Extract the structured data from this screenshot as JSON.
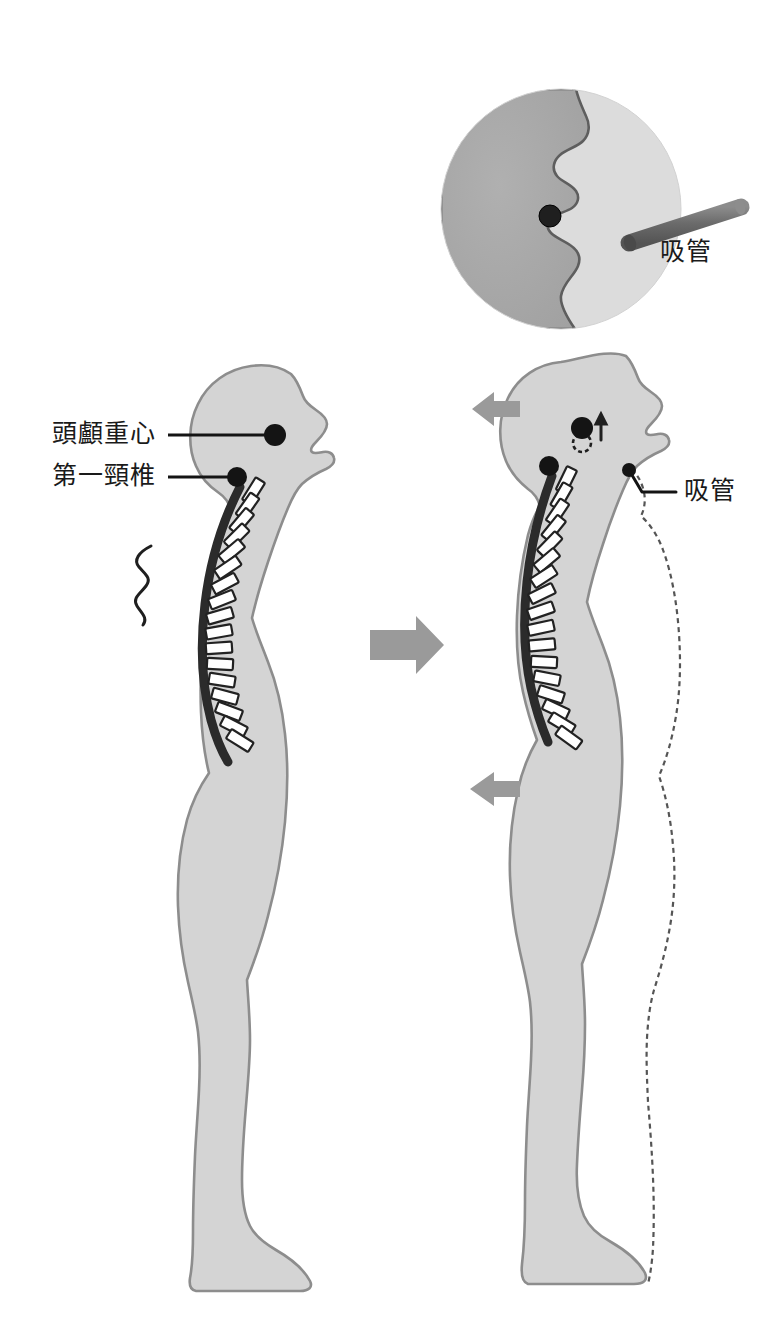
{
  "figure": {
    "title": "",
    "type": "posture-correction-diagram",
    "canvas": {
      "width": 780,
      "height": 1341,
      "background": "#ffffff"
    }
  },
  "colors": {
    "body_fill": "#d4d4d4",
    "body_stroke": "#8d8d8d",
    "spine_stroke": "#2b2b2b",
    "vertebra_fill": "#ffffff",
    "marker_dot": "#1a1a1a",
    "arrow_gray": "#9a9a9a",
    "inset_dark_half": "#a8a8a8",
    "inset_light_half": "#dcdcdc",
    "straw_body": "#6f6f6f",
    "straw_tip": "#4a4a4a",
    "label_text": "#1a1a1a",
    "dashed_outline": "#555555"
  },
  "labels": {
    "head_cog": "頭顱重心",
    "first_cervical": "第一頸椎",
    "straw_inset": "吸管",
    "straw_figure": "吸管"
  },
  "inset": {
    "name": "magnified-mouth-view",
    "center_x": 561,
    "center_y": 209,
    "radius": 120,
    "contents": [
      "face-profile-silhouette",
      "mouth-dot",
      "straw",
      "straw-label"
    ]
  },
  "left_figure": {
    "name": "slouched-posture-figure",
    "description": "側面站姿：頭部前傾、胸椎後凸（駝背）、腹部前凸",
    "markers": [
      {
        "name": "head-cog-dot",
        "x": 275,
        "y": 435,
        "label": "頭顱重心"
      },
      {
        "name": "first-cervical-dot",
        "x": 237,
        "y": 477,
        "label": "第一頸椎"
      }
    ],
    "pain_mark": {
      "name": "pain-squiggle",
      "x": 138,
      "y": 580
    },
    "spine_vertebrae_count": 22
  },
  "right_figure": {
    "name": "corrected-posture-figure",
    "description": "以吸管引導後的姿勢：下巴內收、頭顱重心上移後移、脊柱排列變直",
    "markers": [
      {
        "name": "head-cog-dot",
        "x": 582,
        "y": 428
      },
      {
        "name": "old-cog-dashed-circle",
        "x": 582,
        "y": 442
      },
      {
        "name": "first-cervical-dot",
        "x": 549,
        "y": 466
      },
      {
        "name": "mouth-straw-dot",
        "x": 628,
        "y": 470
      }
    ],
    "arrows": [
      {
        "name": "head-back-arrow",
        "direction": "left",
        "x": 487,
        "y": 408
      },
      {
        "name": "trunk-back-arrow",
        "direction": "left",
        "x": 470,
        "y": 789
      },
      {
        "name": "cog-up-arrow",
        "direction": "up",
        "x": 601,
        "y": 424
      }
    ],
    "ghost_outline": "dashed previous posture",
    "spine_vertebrae_count": 22
  },
  "transition_arrow": {
    "name": "transition-arrow",
    "direction": "right",
    "x": 370,
    "y": 645
  }
}
